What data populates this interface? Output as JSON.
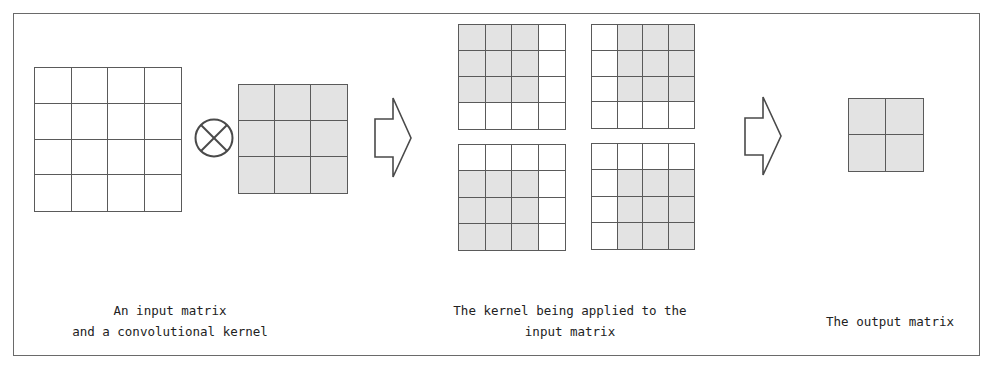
{
  "diagram": {
    "colors": {
      "line": "#5a5a5a",
      "shaded": "#e3e3e3",
      "background": "#ffffff",
      "text": "#222222"
    },
    "input_matrix": {
      "rows": 4,
      "cols": 4,
      "shaded": []
    },
    "operator": {
      "symbol": "⊗",
      "icon": "circled-times-icon"
    },
    "kernel": {
      "rows": 3,
      "cols": 3,
      "shaded": "all"
    },
    "arrow_1": {
      "icon": "right-arrow-icon"
    },
    "applications": [
      {
        "position": "top-left",
        "rows": 4,
        "cols": 4,
        "shaded_rows": [
          0,
          1,
          2
        ],
        "shaded_cols": [
          0,
          1,
          2
        ]
      },
      {
        "position": "top-right",
        "rows": 4,
        "cols": 4,
        "shaded_rows": [
          0,
          1,
          2
        ],
        "shaded_cols": [
          1,
          2,
          3
        ]
      },
      {
        "position": "bottom-left",
        "rows": 4,
        "cols": 4,
        "shaded_rows": [
          1,
          2,
          3
        ],
        "shaded_cols": [
          0,
          1,
          2
        ]
      },
      {
        "position": "bottom-right",
        "rows": 4,
        "cols": 4,
        "shaded_rows": [
          1,
          2,
          3
        ],
        "shaded_cols": [
          1,
          2,
          3
        ]
      }
    ],
    "arrow_2": {
      "icon": "right-arrow-icon"
    },
    "output_matrix": {
      "rows": 2,
      "cols": 2,
      "shaded": "all"
    },
    "captions": {
      "input": "An input matrix\nand a convolutional kernel",
      "applied": "The kernel being applied to the\ninput matrix",
      "output": "The output matrix"
    }
  }
}
